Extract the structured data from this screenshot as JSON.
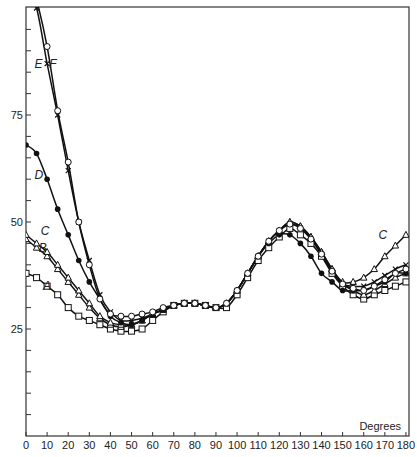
{
  "chart_data": {
    "type": "line",
    "title": "",
    "xlabel": "Degrees",
    "ylabel": "",
    "xlim": [
      0,
      180
    ],
    "ylim": [
      0,
      100
    ],
    "grid": false,
    "legend": "inline curve labels",
    "x_ticks": [
      0,
      10,
      20,
      30,
      40,
      50,
      60,
      70,
      80,
      90,
      100,
      110,
      120,
      130,
      140,
      150,
      160,
      170,
      180
    ],
    "y_tick_labels": [
      25,
      50,
      75
    ],
    "y_minor_tick_step": 5,
    "x": [
      0,
      5,
      10,
      15,
      20,
      25,
      30,
      35,
      40,
      45,
      50,
      55,
      60,
      65,
      70,
      75,
      80,
      85,
      90,
      95,
      100,
      105,
      110,
      115,
      120,
      125,
      130,
      135,
      140,
      145,
      150,
      155,
      160,
      165,
      170,
      175,
      180
    ],
    "series": [
      {
        "name": "A",
        "marker": "open-square",
        "values": [
          38,
          37,
          35,
          33,
          30,
          28,
          27,
          26,
          25,
          24.5,
          24.5,
          25,
          27,
          29,
          30.5,
          31,
          31,
          30.5,
          30,
          30,
          33,
          37,
          41,
          44,
          46.5,
          48.5,
          47,
          45,
          42,
          38,
          35,
          33,
          32,
          33,
          34,
          35,
          36
        ]
      },
      {
        "name": "B",
        "marker": "open-triangle",
        "values": [
          46,
          44,
          42,
          39,
          36,
          33,
          30,
          27.5,
          26,
          25.5,
          26,
          27,
          28.5,
          29.5,
          30.5,
          31,
          31,
          30.5,
          30,
          31,
          34,
          38,
          42,
          45.5,
          48,
          50,
          49,
          46.5,
          43,
          39,
          35.5,
          34,
          33,
          34,
          35.5,
          37,
          38
        ]
      },
      {
        "name": "C",
        "marker": "open-triangle",
        "values": [
          47,
          45,
          43,
          40,
          37,
          34,
          31,
          28,
          26.5,
          26,
          26,
          27,
          28.5,
          29.5,
          30.5,
          31,
          31,
          30.5,
          30,
          31,
          34,
          38,
          42,
          45.5,
          48,
          50,
          49,
          46.5,
          43,
          39,
          36,
          36,
          37,
          39,
          42,
          44.5,
          47
        ]
      },
      {
        "name": "D",
        "marker": "filled-circle",
        "values": [
          68,
          66,
          60,
          53,
          47,
          41,
          36,
          32,
          28,
          26.5,
          26,
          27,
          28.5,
          29.5,
          30.5,
          31,
          31,
          30.5,
          30,
          31,
          34,
          38,
          42,
          45,
          47,
          47,
          45,
          42,
          38,
          36,
          34,
          34,
          34,
          35,
          36,
          38,
          38
        ]
      },
      {
        "name": "E",
        "marker": "cross",
        "values": [
          105,
          100,
          87,
          75,
          62,
          50,
          41,
          33,
          29,
          27,
          27,
          27.5,
          28.5,
          29.5,
          30.5,
          31,
          31,
          30.5,
          30,
          31,
          34,
          38,
          42,
          45.5,
          48,
          49.5,
          48.5,
          46,
          42.5,
          38.5,
          35.5,
          35,
          35,
          36,
          37.5,
          39,
          40
        ]
      },
      {
        "name": "F",
        "marker": "open-circle",
        "values": [
          110,
          102,
          91,
          76,
          64,
          50,
          40,
          32,
          28.5,
          28,
          28,
          28.5,
          29,
          30,
          30.5,
          31,
          31,
          30.5,
          30,
          31,
          34,
          38,
          42,
          45.5,
          48,
          49.5,
          48.5,
          46,
          42.5,
          38.5,
          35.5,
          34.5,
          34,
          35,
          36.5,
          38,
          39
        ]
      }
    ],
    "annotations": [
      {
        "text": "A",
        "x": 8,
        "y": 34
      },
      {
        "text": "B",
        "x": 6,
        "y": 43
      },
      {
        "text": "C",
        "x": 7,
        "y": 47
      },
      {
        "text": "C",
        "x": 167,
        "y": 46
      },
      {
        "text": "D",
        "x": 4,
        "y": 60
      },
      {
        "text": "E",
        "x": 4,
        "y": 86
      },
      {
        "text": "F",
        "x": 11,
        "y": 86
      }
    ]
  }
}
